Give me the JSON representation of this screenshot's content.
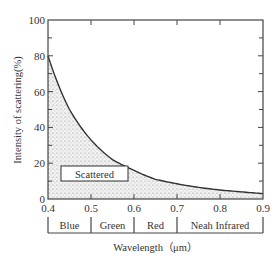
{
  "chart_data": {
    "type": "area",
    "title": "",
    "xlabel": "Wavelength（μm）",
    "ylabel": "Intensity of scattering(%)",
    "xlim": [
      0.4,
      0.9
    ],
    "ylim": [
      0,
      100
    ],
    "x_ticks": [
      "0.4",
      "0.5",
      "0.6",
      "0.7",
      "0.8",
      "0.9"
    ],
    "y_ticks": [
      "0",
      "20",
      "40",
      "60",
      "80",
      "100"
    ],
    "grid": false,
    "series": [
      {
        "name": "Scattered",
        "x": [
          0.4,
          0.45,
          0.5,
          0.55,
          0.6,
          0.65,
          0.7,
          0.75,
          0.8,
          0.85,
          0.9
        ],
        "values": [
          80,
          50,
          33,
          22,
          16,
          11,
          8.5,
          6.5,
          5,
          4,
          3
        ]
      }
    ],
    "legend": {
      "entries": [
        "Scattered"
      ],
      "position": "lower-left inside plot"
    },
    "bands": [
      {
        "label": "Blue",
        "from": 0.4,
        "to": 0.5
      },
      {
        "label": "Green",
        "from": 0.5,
        "to": 0.6
      },
      {
        "label": "Red",
        "from": 0.6,
        "to": 0.7
      },
      {
        "label": "Neah Infrared",
        "from": 0.7,
        "to": 0.9
      }
    ],
    "colors": {
      "line": "#333333",
      "fill": "#bdbdbd",
      "axis": "#444444"
    }
  }
}
